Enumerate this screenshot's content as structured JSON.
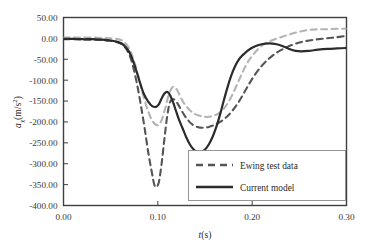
{
  "chart_data": {
    "type": "line",
    "title": "",
    "xlabel": "t(s)",
    "ylabel": "a_x(m/s^2)",
    "ylabel_parts": {
      "symbol": "a",
      "subscript": "x",
      "unit_prefix": "(m/s",
      "unit_exponent": "2",
      "unit_suffix": ")"
    },
    "xlim": [
      0.0,
      0.3
    ],
    "ylim": [
      -400.0,
      50.0
    ],
    "xticks": [
      0.0,
      0.1,
      0.2,
      0.3
    ],
    "xtick_labels": [
      "0.00",
      "0.10",
      "0.20",
      "0.30"
    ],
    "yticks": [
      50.0,
      0.0,
      -50.0,
      -100.0,
      -150.0,
      -200.0,
      -250.0,
      -300.0,
      -350.0,
      -400.0
    ],
    "ytick_labels": [
      "50.00",
      "0.00",
      "-50.00",
      "-100.00",
      "-150.00",
      "-200.00",
      "-250.00",
      "-300.00",
      "-350.00",
      "-400.00"
    ],
    "grid": false,
    "legend_position": "lower right",
    "legend_entries": [
      "Ewing test data",
      "Current model"
    ],
    "series": [
      {
        "name": "Ewing test data",
        "style": "dashed",
        "color": "#555555",
        "x": [
          0.0,
          0.01,
          0.02,
          0.03,
          0.04,
          0.05,
          0.058,
          0.064,
          0.07,
          0.074,
          0.078,
          0.082,
          0.086,
          0.09,
          0.094,
          0.096,
          0.098,
          0.101,
          0.104,
          0.107,
          0.11,
          0.113,
          0.117,
          0.121,
          0.125,
          0.13,
          0.136,
          0.142,
          0.148,
          0.154,
          0.16,
          0.166,
          0.172,
          0.178,
          0.184,
          0.19,
          0.196,
          0.202,
          0.21,
          0.218,
          0.226,
          0.234,
          0.242,
          0.25,
          0.258,
          0.266,
          0.274,
          0.282,
          0.29,
          0.3
        ],
        "y": [
          -2,
          -2,
          -3,
          -3,
          -4,
          -6,
          -10,
          -18,
          -40,
          -70,
          -110,
          -160,
          -215,
          -275,
          -325,
          -348,
          -356,
          -345,
          -300,
          -240,
          -185,
          -152,
          -146,
          -156,
          -172,
          -190,
          -205,
          -212,
          -214,
          -212,
          -207,
          -200,
          -190,
          -176,
          -158,
          -136,
          -112,
          -90,
          -66,
          -48,
          -34,
          -24,
          -16,
          -10,
          -6,
          -3,
          -1,
          1,
          3,
          6
        ]
      },
      {
        "name": "Ewing test data (secondary)",
        "style": "dashed",
        "color": "#b4b4b4",
        "x": [
          0.0,
          0.01,
          0.02,
          0.03,
          0.04,
          0.05,
          0.058,
          0.064,
          0.07,
          0.075,
          0.08,
          0.085,
          0.09,
          0.095,
          0.1,
          0.104,
          0.108,
          0.112,
          0.116,
          0.12,
          0.124,
          0.128,
          0.134,
          0.14,
          0.146,
          0.152,
          0.158,
          0.164,
          0.17,
          0.176,
          0.182,
          0.188,
          0.194,
          0.2,
          0.208,
          0.216,
          0.224,
          0.232,
          0.24,
          0.248,
          0.256,
          0.264,
          0.272,
          0.28,
          0.29,
          0.3
        ],
        "y": [
          2,
          2,
          2,
          2,
          1,
          0,
          -2,
          -8,
          -26,
          -56,
          -96,
          -140,
          -176,
          -200,
          -208,
          -196,
          -166,
          -132,
          -116,
          -122,
          -140,
          -156,
          -172,
          -182,
          -186,
          -188,
          -186,
          -180,
          -168,
          -148,
          -120,
          -90,
          -62,
          -42,
          -22,
          -10,
          -2,
          4,
          10,
          15,
          19,
          21,
          22,
          22,
          23,
          23
        ]
      },
      {
        "name": "Current model",
        "style": "solid",
        "color": "#2b2b2b",
        "x": [
          0.0,
          0.01,
          0.02,
          0.03,
          0.04,
          0.05,
          0.058,
          0.064,
          0.07,
          0.075,
          0.08,
          0.085,
          0.09,
          0.094,
          0.098,
          0.101,
          0.104,
          0.107,
          0.11,
          0.113,
          0.116,
          0.119,
          0.122,
          0.126,
          0.13,
          0.134,
          0.138,
          0.142,
          0.146,
          0.15,
          0.154,
          0.158,
          0.162,
          0.166,
          0.17,
          0.174,
          0.178,
          0.182,
          0.186,
          0.19,
          0.196,
          0.202,
          0.21,
          0.218,
          0.226,
          0.234,
          0.24,
          0.246,
          0.252,
          0.26,
          0.27,
          0.28,
          0.29,
          0.3
        ],
        "y": [
          -1,
          -1,
          -2,
          -2,
          -3,
          -5,
          -9,
          -16,
          -34,
          -62,
          -98,
          -132,
          -152,
          -162,
          -164,
          -158,
          -144,
          -132,
          -128,
          -136,
          -152,
          -172,
          -192,
          -214,
          -236,
          -254,
          -266,
          -272,
          -272,
          -266,
          -254,
          -236,
          -212,
          -182,
          -148,
          -116,
          -88,
          -66,
          -50,
          -40,
          -28,
          -20,
          -14,
          -12,
          -14,
          -20,
          -26,
          -30,
          -31,
          -30,
          -27,
          -25,
          -24,
          -23
        ]
      }
    ]
  },
  "axes": {
    "x_axis_name": "time-axis",
    "y_axis_name": "acceleration-axis"
  }
}
